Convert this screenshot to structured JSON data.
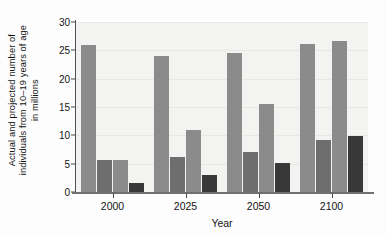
{
  "chart_data": {
    "type": "bar",
    "title": "",
    "xlabel": "Year",
    "ylabel": "Actual and projected number of individuals from 10–19 years of age in millions",
    "ylabel_lines": [
      "Actual and projected number of",
      "individuals from 10–19 years of age",
      "in millions"
    ],
    "categories": [
      "2000",
      "2025",
      "2050",
      "2100"
    ],
    "ylim": [
      0,
      30
    ],
    "yticks": [
      0,
      5,
      10,
      15,
      20,
      25,
      30
    ],
    "ytick_labels": [
      "0",
      "5",
      "10",
      "15",
      "20",
      "25",
      "30"
    ],
    "grid": true,
    "legend": "none",
    "series": [
      {
        "name": "series-1",
        "color": "#8b8b8b",
        "values": [
          25.9,
          24.0,
          24.6,
          26.2
        ]
      },
      {
        "name": "series-2",
        "color": "#6e6e6e",
        "values": [
          5.7,
          6.1,
          7.0,
          9.2
        ]
      },
      {
        "name": "series-3",
        "color": "#8b8b8b",
        "values": [
          5.6,
          10.9,
          15.5,
          26.6
        ]
      },
      {
        "name": "series-4",
        "color": "#383838",
        "values": [
          1.6,
          3.0,
          5.1,
          9.8
        ]
      }
    ]
  },
  "colors": {
    "plot_background": "#f3f3f1",
    "figure_background": "#fdfdfd",
    "gridline": "#e7e7e4",
    "axis": "#4f4f4f",
    "text": "#141414"
  }
}
